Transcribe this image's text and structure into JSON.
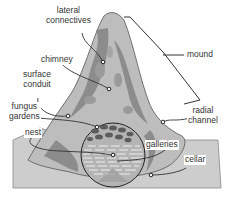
{
  "diagram": {
    "type": "labeled-cross-section",
    "labels": {
      "lateral_connectives_1": "lateral",
      "lateral_connectives_2": "connectives",
      "chimney": "chimney",
      "surface_conduit_1": "surface",
      "surface_conduit_2": "conduit",
      "fungus_gardens_1": "fungus",
      "fungus_gardens_2": "gardens",
      "nest": "nest",
      "mound": "mound",
      "radial_channel_1": "radial",
      "radial_channel_2": "channel",
      "galleries": "galleries",
      "cellar": "cellar"
    },
    "colors": {
      "ground": "#c8c8c8",
      "mound_light": "#bdbdbd",
      "mound_dark": "#8a8a8a",
      "outline": "#333333"
    }
  }
}
